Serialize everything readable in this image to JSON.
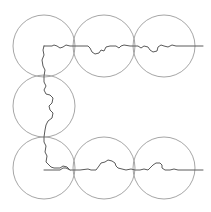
{
  "diagram": {
    "background": "#ffffff",
    "circle_color": "#a6a6a6",
    "path_color": "#5a5a5a",
    "radius": 31,
    "circles": [
      {
        "id": "top-left",
        "cx": 44,
        "cy": 46
      },
      {
        "id": "top-middle",
        "cx": 104,
        "cy": 46
      },
      {
        "id": "top-right",
        "cx": 164,
        "cy": 46
      },
      {
        "id": "middle-left",
        "cx": 44,
        "cy": 106
      },
      {
        "id": "bottom-left",
        "cx": 44,
        "cy": 168
      },
      {
        "id": "bottom-middle",
        "cx": 104,
        "cy": 168
      },
      {
        "id": "bottom-right",
        "cx": 164,
        "cy": 168
      }
    ],
    "paths": [
      {
        "id": "top-branch",
        "d": "M44 46 L52 46 L54 45 L57 46 L60 48 L63 47 L66 45 L70 46 L80 46 L88 46 L90 48 L92 52 L95 54 L99 53 L101 50 L104 51 L106 47 L110 46 L116 46 L119 48 L121 46 L124 45 L130 46 L138 46 L141 48 L144 46 L148 47 L150 50 L153 52 L157 51 L158 47 L161 45 L164 46 L168 47 L172 45 L176 46 L190 46 L203 46"
      },
      {
        "id": "vertical-branch",
        "d": "M44 46 L43 50 L44 55 L42 60 L43 66 L45 70 L44 76 L44 82 L46 86 L44 90 L46 94 L50 95 L53 98 L52 103 L49 106 L50 110 L53 113 L52 118 L48 121 L46 125 L45 130 L44 137 L44 142 L46 146 L45 152 L47 156 L46 162 L49 165 L51 167 L54 168 L60 168 L63 166 L67 167 L70 170"
      },
      {
        "id": "bottom-branch",
        "d": "M44 170 L60 170 L63 168 L66 168 L70 170 L80 170 L88 169 L91 170 L96 170 L99 166 L101 163 L105 162 L108 160 L112 161 L115 163 L116 166 L118 168 L122 169 L126 170 L131 169 L135 170 L140 170 L144 169 L148 170 L151 167 L153 165 L156 163 L160 163 L162 165 L162 168 L165 170 L170 170 L174 169 L178 170 L184 170 L190 170 L203 170"
      }
    ]
  }
}
